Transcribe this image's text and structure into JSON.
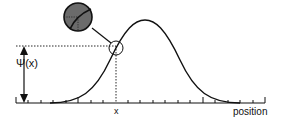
{
  "diagram": {
    "title": "",
    "y_label": "Ψ(x)",
    "x_marker_label": "x",
    "x_axis_label": "position",
    "colors": {
      "curve": "#111111",
      "inset_fill": "#6b6b6b",
      "background": "#ffffff"
    }
  }
}
